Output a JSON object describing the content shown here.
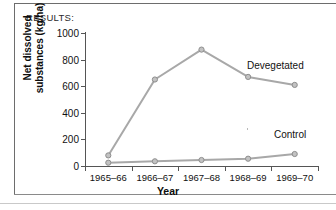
{
  "panel": {
    "results_label": "RESULTS:"
  },
  "chart_data": {
    "type": "line",
    "title": "",
    "xlabel": "Year",
    "ylabel": "Net dissolved substances (kg/ha)",
    "ylabel_line1": "Net dissolved",
    "ylabel_line2": "substances (kg/ha)",
    "categories": [
      "1965–66",
      "1966–67",
      "1967–68",
      "1968–69",
      "1969–70"
    ],
    "yticks": [
      0,
      200,
      400,
      600,
      800,
      1000
    ],
    "ytick_labels": [
      "0",
      "200",
      "400",
      "600",
      "800",
      "1000"
    ],
    "ylim": [
      0,
      1000
    ],
    "grid": false,
    "legend_position": "inline-right",
    "series": [
      {
        "name": "Devegetated",
        "values": [
          80,
          650,
          875,
          670,
          610
        ],
        "color": "#a8a8a8",
        "marker": "circle"
      },
      {
        "name": "Control",
        "values": [
          25,
          35,
          45,
          55,
          90
        ],
        "color": "#a8a8a8",
        "marker": "circle"
      }
    ],
    "annotations": [
      {
        "text": "Devegetated",
        "series": "Devegetated"
      },
      {
        "text": "Control",
        "series": "Control"
      }
    ]
  },
  "style": {
    "line_color": "#a8a8a8",
    "marker_fill": "#c2c2c2",
    "marker_stroke": "#8e8e8e",
    "axis_color": "#555555",
    "text_color": "#111111",
    "frame_color": "#6d6d6d",
    "background": "#ffffff"
  }
}
